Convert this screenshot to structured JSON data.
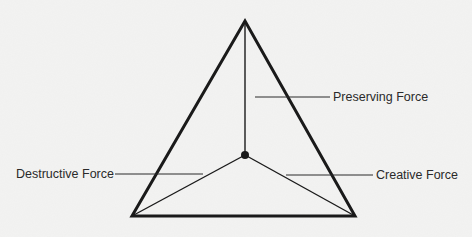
{
  "diagram": {
    "type": "triangle-force-diagram",
    "background_color": "#f3f3f2",
    "stroke_color": "#1a1a1a",
    "labels": {
      "preserving": "Preserving Force",
      "destructive": "Destructive Force",
      "creative": "Creative Force"
    },
    "vertices": {
      "apex": [
        245,
        21
      ],
      "bottom_left": [
        132,
        216
      ],
      "bottom_right": [
        355,
        216
      ],
      "center": [
        245,
        155
      ]
    }
  }
}
